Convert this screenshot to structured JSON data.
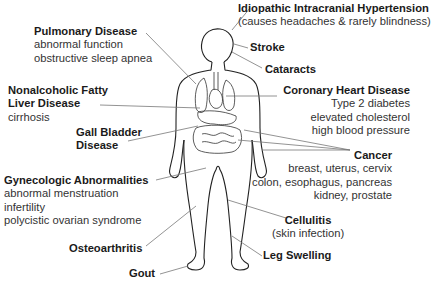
{
  "diagram": {
    "labels": {
      "pulmonary": {
        "title": "Pulmonary Disease",
        "lines": [
          "abnormal function",
          "obstructive sleep apnea"
        ]
      },
      "iih": {
        "title": "Idiopathic Intracranial Hypertension",
        "lines": [
          "(causes headaches & rarely blindness)"
        ]
      },
      "stroke": {
        "title": "Stroke"
      },
      "cataracts": {
        "title": "Cataracts"
      },
      "nafld": {
        "title_line1": "Nonalcoholic Fatty",
        "title_line2": "Liver Disease",
        "lines": [
          "cirrhosis"
        ]
      },
      "chd": {
        "title": "Coronary Heart Disease",
        "lines": [
          "Type 2 diabetes",
          "elevated cholesterol",
          "high blood pressure"
        ]
      },
      "gallbladder": {
        "title_line1": "Gall Bladder",
        "title_line2": "Disease"
      },
      "cancer": {
        "title": "Cancer",
        "lines": [
          "breast, uterus, cervix",
          "colon, esophagus, pancreas",
          "kidney, prostate"
        ]
      },
      "gyn": {
        "title": "Gynecologic Abnormalities",
        "lines": [
          "abnormal menstruation",
          "infertility",
          "polycistic ovarian syndrome"
        ]
      },
      "cellulitis": {
        "title": "Cellulitis",
        "lines": [
          "(skin infection)"
        ]
      },
      "osteo": {
        "title": "Osteoarthritis"
      },
      "leg": {
        "title": "Leg Swelling"
      },
      "gout": {
        "title": "Gout"
      }
    },
    "colors": {
      "outline": "#222222",
      "pointer": "#777777",
      "text": "#1a1a1a"
    }
  }
}
